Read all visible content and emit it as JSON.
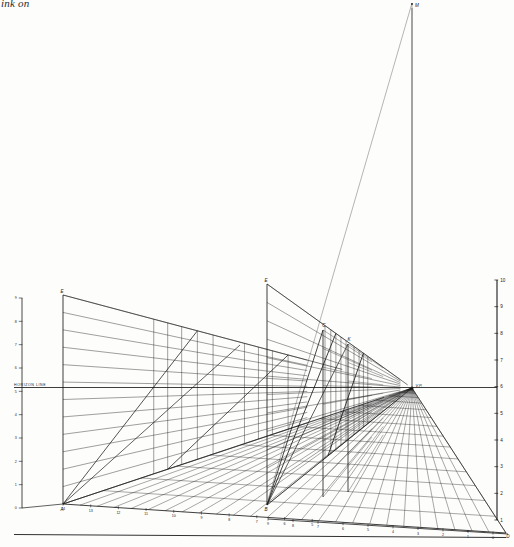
{
  "plate": {
    "caption": "ink on",
    "horizon_label": "HORIZON LINE",
    "vanishing_point_label": "V.P.",
    "measuring_point_label": "M"
  },
  "left_scale": {
    "name": "left vertical measuring scale",
    "x": 22,
    "y_top": 298,
    "y_bottom": 508,
    "ticks": [
      "9",
      "8",
      "7",
      "6",
      "5",
      "4",
      "3",
      "2",
      "1",
      "0"
    ]
  },
  "right_scale": {
    "name": "right vertical measuring scale",
    "x": 497,
    "y_top": 280,
    "y_bottom": 520,
    "ticks": [
      "10",
      "9",
      "8",
      "7",
      "6",
      "5",
      "4",
      "3",
      "2",
      "1"
    ]
  },
  "ground_line_left": {
    "name": "left ground line scale",
    "labels": [
      "14",
      "13",
      "12",
      "11",
      "10",
      "9",
      "8",
      "7",
      "6",
      "5"
    ]
  },
  "ground_line_right": {
    "name": "right ground line scale",
    "labels": [
      "9",
      "8",
      "7",
      "6",
      "5",
      "4",
      "3",
      "2",
      "1",
      "0"
    ]
  },
  "point_labels": {
    "left_wall_top": "E",
    "mid_wall_top": "E",
    "inner_vertical_a": "C",
    "inner_vertical_b": "K",
    "left_wall_base": "A",
    "mid_wall_base": "B",
    "floor_corner": "D"
  },
  "geometry": {
    "horizon_y": 387.5,
    "vp_x": 412,
    "vp_y": 388,
    "mp_x": 412,
    "mp_y": 3,
    "baseline_y": 535,
    "ink_color": "#1b1b1b",
    "light_ink": "#5c5c5c",
    "paper": "#fdfdfc"
  }
}
